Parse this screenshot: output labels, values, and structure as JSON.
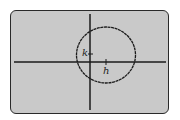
{
  "screen": {
    "background": "#c9c9c9",
    "border_color": "#2a2a2a"
  },
  "graph": {
    "type": "circle",
    "description": "Circle with center (h, k) on a graphing calculator screen",
    "center_labels": {
      "h": "h",
      "k": "k"
    },
    "axes": {
      "x_axis": true,
      "y_axis": true,
      "color": "#1a1a1a"
    },
    "curve_color": "#1a1a1a"
  }
}
